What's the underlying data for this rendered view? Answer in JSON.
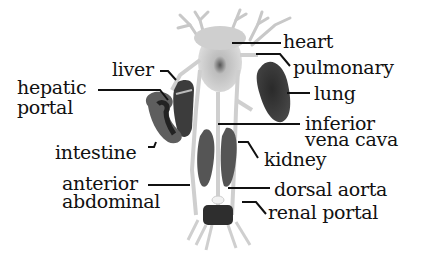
{
  "diagram": {
    "labels": {
      "heart": "heart",
      "pulmonary": "pulmonary",
      "lung": "lung",
      "inferior_vena_cava_line1": "inferior",
      "inferior_vena_cava_line2": "vena cava",
      "kidney": "kidney",
      "dorsal_aorta": "dorsal aorta",
      "renal_portal": "renal portal",
      "liver": "liver",
      "hepatic_portal_line1": "hepatic",
      "hepatic_portal_line2": "portal",
      "intestine": "intestine",
      "anterior_abdominal_line1": "anterior",
      "anterior_abdominal_line2": "abdominal"
    },
    "colors": {
      "organ_dark": "#3a3a3a",
      "organ_mid": "#6e6e6e",
      "vessel": "#cfcfcf",
      "heart": "#d9d9d9",
      "leader_line": "#111111",
      "background": "#ffffff"
    }
  }
}
